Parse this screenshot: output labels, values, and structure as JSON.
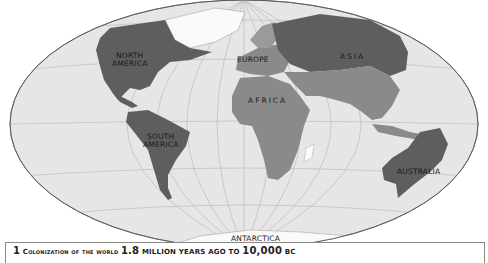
{
  "map": {
    "projection": "Mollweide-style world map",
    "colors": {
      "ocean": "#e6e6e6",
      "land_colonized_early": "#8a8a8a",
      "land_colonized_late": "#5e5e5e",
      "ice": "#ffffff",
      "graticule": "#b5b5b5",
      "border": "#555555"
    },
    "labels": [
      {
        "id": "north-america",
        "text": "NORTH\nAMERICA"
      },
      {
        "id": "europe",
        "text": "EUROPE"
      },
      {
        "id": "asia",
        "text": "ASIA"
      },
      {
        "id": "africa",
        "text": "AFRICA"
      },
      {
        "id": "south-america",
        "text": "SOUTH\nAMERICA"
      },
      {
        "id": "australia",
        "text": "AUSTRALIA"
      },
      {
        "id": "antarctica",
        "text": "ANTARCTICA"
      }
    ]
  },
  "caption": {
    "number": "1",
    "part1": "Colonization of the world",
    "value1": "1.8",
    "part2": "million years ago to",
    "value2": "10,000",
    "part3": "BC"
  }
}
